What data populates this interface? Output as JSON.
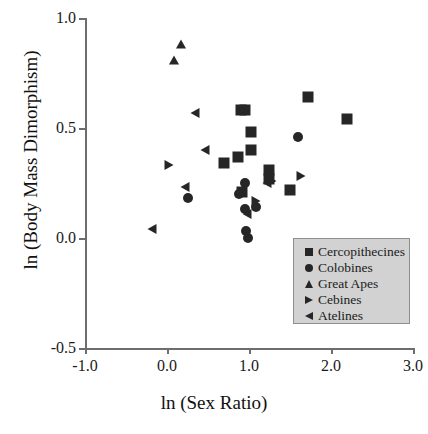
{
  "chart_data": {
    "type": "scatter",
    "title": "",
    "xlabel": "ln (Sex Ratio)",
    "ylabel": "ln (Body Mass Dimorphism)",
    "xlim": [
      -1.0,
      3.0
    ],
    "ylim": [
      -0.5,
      1.0
    ],
    "xticks": [
      "-1.0",
      "0.0",
      "1.0",
      "2.0",
      "3.0"
    ],
    "xtick_values": [
      -1.0,
      0.0,
      1.0,
      2.0,
      3.0
    ],
    "yticks": [
      "1.0",
      "0.5",
      "0.0",
      "-0.5"
    ],
    "ytick_values": [
      1.0,
      0.5,
      0.0,
      -0.5
    ],
    "grid": false,
    "legend_position": "lower-right",
    "marker_color": "#262626",
    "axis_color": "#6d6d6d",
    "legend_background": "#d2d2d2",
    "legend_border": "#8e8e8e",
    "series": [
      {
        "name": "Cercopithecines",
        "marker": "square",
        "points": [
          [
            0.9,
            0.58
          ],
          [
            0.95,
            0.58
          ],
          [
            1.02,
            0.48
          ],
          [
            1.02,
            0.4
          ],
          [
            0.87,
            0.37
          ],
          [
            0.69,
            0.34
          ],
          [
            1.24,
            0.31
          ],
          [
            1.5,
            0.22
          ],
          [
            0.91,
            0.21
          ],
          [
            1.72,
            0.64
          ],
          [
            2.2,
            0.54
          ],
          [
            1.24,
            0.27
          ]
        ]
      },
      {
        "name": "Colobines",
        "marker": "circle",
        "points": [
          [
            1.6,
            0.46
          ],
          [
            0.95,
            0.25
          ],
          [
            0.26,
            0.18
          ],
          [
            0.88,
            0.2
          ],
          [
            0.95,
            0.13
          ],
          [
            1.09,
            0.14
          ],
          [
            0.96,
            0.03
          ],
          [
            0.99,
            0.0
          ]
        ]
      },
      {
        "name": "Great Apes",
        "marker": "triangle-up",
        "points": [
          [
            0.17,
            0.88
          ],
          [
            0.08,
            0.81
          ]
        ]
      },
      {
        "name": "Cebines",
        "marker": "triangle-right",
        "points": [
          [
            0.02,
            0.33
          ],
          [
            1.09,
            0.17
          ],
          [
            1.28,
            0.26
          ],
          [
            1.64,
            0.28
          ]
        ]
      },
      {
        "name": "Atelines",
        "marker": "triangle-left",
        "points": [
          [
            0.34,
            0.57
          ],
          [
            0.46,
            0.4
          ],
          [
            0.22,
            0.23
          ],
          [
            -0.18,
            0.04
          ],
          [
            0.97,
            0.11
          ],
          [
            1.22,
            0.25
          ]
        ]
      }
    ]
  },
  "legend": {
    "entries": [
      {
        "label": "Cercopithecines",
        "marker": "square"
      },
      {
        "label": "Colobines",
        "marker": "circle"
      },
      {
        "label": "Great Apes",
        "marker": "triangle-up"
      },
      {
        "label": "Cebines",
        "marker": "triangle-right"
      },
      {
        "label": "Atelines",
        "marker": "triangle-left"
      }
    ]
  }
}
